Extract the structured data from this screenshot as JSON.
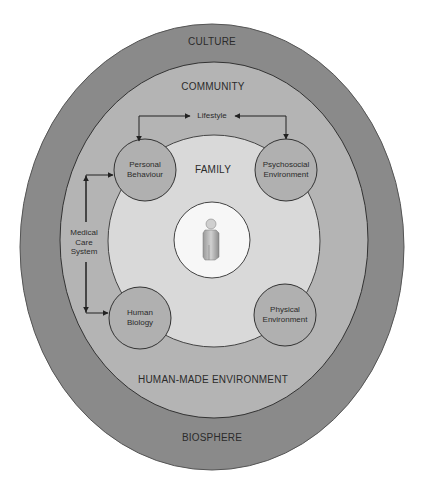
{
  "diagram": {
    "colors": {
      "culture": "#8a8a8a",
      "community": "#b4b4b4",
      "family": "#d9d9d9",
      "center": "#f7f7f7",
      "node": "#b0b0b0",
      "stroke": "#333333"
    },
    "layers": {
      "culture": "CULTURE",
      "community": "COMMUNITY",
      "family": "FAMILY",
      "human_made": "HUMAN-MADE ENVIRONMENT",
      "biosphere": "BIOSPHERE"
    },
    "nodes": {
      "personal_behaviour": {
        "line1": "Personal",
        "line2": "Behaviour"
      },
      "psychosocial": {
        "line1": "Psychosocial",
        "line2": "Environment"
      },
      "human_biology": {
        "line1": "Human",
        "line2": "Biology"
      },
      "physical": {
        "line1": "Physical",
        "line2": "Environment"
      }
    },
    "connectors": {
      "lifestyle": "Lifestyle",
      "medical_care": {
        "line1": "Medical",
        "line2": "Care",
        "line3": "System"
      }
    },
    "center_icon": "person-figure-icon"
  }
}
